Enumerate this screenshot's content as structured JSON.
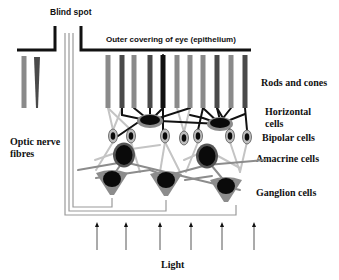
{
  "diagram": {
    "labels": {
      "blind_spot": "Blind spot",
      "epithelium": "Outer covering of eye (epithelium)",
      "rods_cones": "Rods and cones",
      "horizontal_line1": "Horizontal",
      "horizontal_line2": "cells",
      "bipolar": "Bipolar cells",
      "amacrine": "Amacrine cells",
      "ganglion": "Ganglion cells",
      "optic_line1": "Optic nerve",
      "optic_line2": "fibres",
      "light": "Light"
    },
    "colors": {
      "epithelium": "#111111",
      "rod": "#8a8a8a",
      "cone": "#4a4a4a",
      "fibre": "#999999",
      "connector_light": "#c4c4c4",
      "connector_mid": "#8c8c8c",
      "connector_dark": "#111111",
      "cell_body": "#8c8c8c",
      "nucleus": "#0a0a0a",
      "bipolar_body": "#bdbdbd",
      "arrow": "#444444"
    },
    "photoreceptors": [
      {
        "x": 108,
        "type": "rod"
      },
      {
        "x": 122,
        "type": "cone"
      },
      {
        "x": 134,
        "type": "rod"
      },
      {
        "x": 150,
        "type": "cone"
      },
      {
        "x": 163,
        "type": "dark"
      },
      {
        "x": 177,
        "type": "rod"
      },
      {
        "x": 190,
        "type": "rod"
      },
      {
        "x": 203,
        "type": "rod"
      },
      {
        "x": 217,
        "type": "cone"
      },
      {
        "x": 231,
        "type": "rod"
      },
      {
        "x": 245,
        "type": "cone"
      }
    ],
    "left_photoreceptors": [
      {
        "x": 24,
        "type": "rod"
      },
      {
        "x": 37,
        "type": "cone"
      }
    ],
    "horizontal_cells": [
      {
        "x": 150,
        "y": 121
      },
      {
        "x": 220,
        "y": 124
      }
    ],
    "bipolar_cells": [
      {
        "x": 113,
        "y": 136
      },
      {
        "x": 131,
        "y": 136
      },
      {
        "x": 165,
        "y": 136
      },
      {
        "x": 184,
        "y": 138
      },
      {
        "x": 198,
        "y": 136
      },
      {
        "x": 230,
        "y": 136
      },
      {
        "x": 247,
        "y": 137
      }
    ],
    "amacrine_cells": [
      {
        "x": 124,
        "y": 155
      },
      {
        "x": 207,
        "y": 156
      }
    ],
    "ganglion_cells": [
      {
        "x": 112,
        "y": 181
      },
      {
        "x": 166,
        "y": 182
      },
      {
        "x": 226,
        "y": 188
      }
    ],
    "light_arrows": [
      97,
      126,
      160,
      191,
      222,
      254
    ]
  }
}
